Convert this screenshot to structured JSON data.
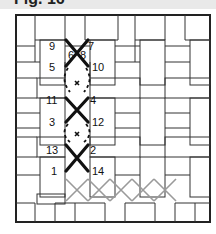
{
  "figure": {
    "title": "Fig. 16",
    "type": "needlework stitch diagram"
  },
  "colors": {
    "grid_line": "#222222",
    "stitch_dark": "#111111",
    "stitch_light": "#9a9a9a",
    "background": "#ffffff",
    "title_band": "#e9e9e9"
  },
  "stitch_numbers": [
    {
      "label": "9",
      "x": 49,
      "y": 50
    },
    {
      "label": "7",
      "x": 88,
      "y": 50
    },
    {
      "label": "6",
      "x": 68,
      "y": 59
    },
    {
      "label": "8",
      "x": 80,
      "y": 59
    },
    {
      "label": "5",
      "x": 49,
      "y": 71
    },
    {
      "label": "10",
      "x": 92,
      "y": 71
    },
    {
      "label": "11",
      "x": 46,
      "y": 104
    },
    {
      "label": "4",
      "x": 90,
      "y": 104
    },
    {
      "label": "3",
      "x": 49,
      "y": 126
    },
    {
      "label": "12",
      "x": 92,
      "y": 126
    },
    {
      "label": "13",
      "x": 46,
      "y": 154
    },
    {
      "label": "2",
      "x": 90,
      "y": 154
    },
    {
      "label": "1",
      "x": 51,
      "y": 175
    },
    {
      "label": "14",
      "x": 92,
      "y": 175
    }
  ]
}
